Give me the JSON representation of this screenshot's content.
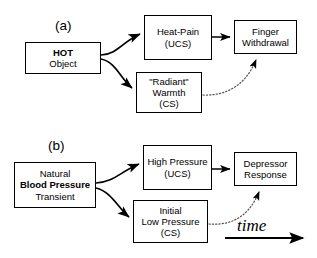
{
  "figure": {
    "panels": [
      {
        "id": "a",
        "label": "(a)",
        "boxes": {
          "source": {
            "line1": "HOT",
            "line2": "Object"
          },
          "ucs": {
            "line1": "Heat-Pain",
            "line2": "(UCS)"
          },
          "response": {
            "line1": "Finger",
            "line2": "Withdrawal"
          },
          "cs": {
            "line1": "\"Radiant\"",
            "line2": "Warmth",
            "line3": "(CS)"
          }
        }
      },
      {
        "id": "b",
        "label": "(b)",
        "boxes": {
          "source": {
            "line1": "Natural",
            "line2": "Blood Pressure",
            "line3": "Transient"
          },
          "ucs": {
            "line1": "High Pressure",
            "line2": "(UCS)"
          },
          "response": {
            "line1": "Depressor",
            "line2": "Response"
          },
          "cs": {
            "line1": "Initial",
            "line2": "Low Pressure",
            "line3": "(CS)"
          }
        }
      }
    ],
    "time_axis": {
      "label": "time"
    },
    "colors": {
      "stroke": "#000000",
      "fill": "#ffffff",
      "dotted_stroke": "#555555"
    }
  }
}
